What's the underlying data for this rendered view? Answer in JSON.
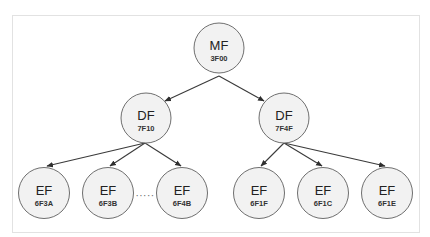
{
  "diagram": {
    "title": "",
    "style": {
      "node_fill": "#f2f2f2",
      "node_stroke": "#6f6f6f",
      "edge_color": "#3a3a3a",
      "frame_stroke": "#e2e2e2"
    },
    "root": {
      "type": "MF",
      "id": "3F00"
    },
    "level1": [
      {
        "type": "DF",
        "id": "7F10"
      },
      {
        "type": "DF",
        "id": "7F4F"
      }
    ],
    "level2": [
      {
        "type": "EF",
        "id": "6F3A",
        "parent": "7F10"
      },
      {
        "type": "EF",
        "id": "6F3B",
        "parent": "7F10"
      },
      {
        "type": "EF",
        "id": "6F4B",
        "parent": "7F10"
      },
      {
        "type": "EF",
        "id": "6F1F",
        "parent": "7F4F"
      },
      {
        "type": "EF",
        "id": "6F1C",
        "parent": "7F4F"
      },
      {
        "type": "EF",
        "id": "6F1E",
        "parent": "7F4F"
      }
    ],
    "ellipsis": "·····",
    "edges": [
      {
        "from": "3F00",
        "to": "7F10"
      },
      {
        "from": "3F00",
        "to": "7F4F"
      },
      {
        "from": "7F10",
        "to": "6F3A"
      },
      {
        "from": "7F10",
        "to": "6F3B"
      },
      {
        "from": "7F10",
        "to": "6F4B"
      },
      {
        "from": "7F4F",
        "to": "6F1F"
      },
      {
        "from": "7F4F",
        "to": "6F1C"
      },
      {
        "from": "7F4F",
        "to": "6F1E"
      }
    ]
  }
}
